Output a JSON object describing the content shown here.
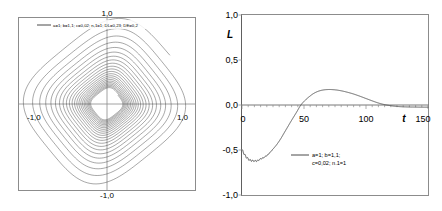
{
  "figure": {
    "background_color": "#ffffff",
    "axis_color": "#8c8c8c",
    "curve_color": "#3c3c3c",
    "panel_count": 2
  },
  "chart_data": [
    {
      "type": "line",
      "name": "phase-portrait",
      "title": "",
      "xlabel": "",
      "ylabel": "",
      "xlim": [
        -1.4,
        1.4
      ],
      "ylim": [
        -1.4,
        1.4
      ],
      "xticks": [
        -1.0,
        1.0
      ],
      "xtick_labels": [
        "-1,0",
        "1,0"
      ],
      "yticks": [
        -1.0,
        1.0
      ],
      "ytick_labels": [
        "-1,0",
        "1,0"
      ],
      "grid": false,
      "legend_position": "top",
      "legend": [
        "a=1; b=1,1; c=0,02; n,1=1; DL=0,23; DE=0,2"
      ],
      "description": "Inward spiralling closed-loop phase trajectory, rounded-square loops decaying from radius ~1.0 toward a dense core near the origin",
      "series": [
        {
          "name": "trajectory",
          "parametric": true,
          "turns": 22,
          "r_start": 1.02,
          "r_end": 0.18,
          "squareness": 0.42,
          "tilt_deg": 38
        }
      ]
    },
    {
      "type": "line",
      "name": "time-series",
      "title": "",
      "xlabel": "t",
      "ylabel": "L",
      "xlim": [
        0,
        150
      ],
      "ylim": [
        -1.0,
        1.0
      ],
      "xticks": [
        0,
        50,
        100,
        150
      ],
      "xtick_labels": [
        "0",
        "50",
        "100",
        "150"
      ],
      "yticks": [
        -1.0,
        -0.5,
        0.0,
        0.5,
        1.0
      ],
      "ytick_labels": [
        "-1,0",
        "-0,5",
        "0,0",
        "0,5",
        "1,0"
      ],
      "grid": false,
      "legend_position": "inside-lower-center",
      "legend": [
        "a=1; b=1,1;",
        "c=0,02; n.1=1"
      ],
      "description": "Damped oscillation of L versus t: begins near -0,50, dips to about -0,62 near t=12, rises through zero at t≈47, peaks at about +0,17 near t=72, returns to zero near t=113 and settles slightly below zero",
      "series": [
        {
          "name": "L(t)",
          "x": [
            0,
            3,
            6,
            9,
            12,
            15,
            18,
            21,
            25,
            28,
            31,
            34,
            37,
            40,
            44,
            47,
            50,
            54,
            58,
            62,
            66,
            70,
            74,
            78,
            82,
            86,
            90,
            95,
            100,
            105,
            110,
            115,
            120,
            125,
            130,
            135,
            140,
            145,
            150
          ],
          "y": [
            -0.5,
            -0.57,
            -0.61,
            -0.62,
            -0.62,
            -0.6,
            -0.58,
            -0.55,
            -0.49,
            -0.44,
            -0.38,
            -0.31,
            -0.24,
            -0.17,
            -0.08,
            -0.01,
            0.04,
            0.09,
            0.13,
            0.155,
            0.168,
            0.172,
            0.17,
            0.163,
            0.152,
            0.138,
            0.122,
            0.098,
            0.072,
            0.046,
            0.022,
            0.004,
            -0.008,
            -0.016,
            -0.02,
            -0.022,
            -0.023,
            -0.024,
            -0.024
          ]
        }
      ]
    }
  ],
  "left_panel": {
    "legend_label": "a=1; b=1,1; c=0,02; n,1=1; DL=0,23; DE=0,2",
    "x_left_label": "-1,0",
    "x_right_label": "1,0",
    "y_top_label": "1,0",
    "y_bottom_label": "-1,0"
  },
  "right_panel": {
    "y_axis_name": "L",
    "x_axis_name": "t",
    "y_labels": [
      "1,0",
      "0,5",
      "0,0",
      "-0,5",
      "-1,0"
    ],
    "x_labels": [
      "0",
      "50",
      "100",
      "150"
    ],
    "legend_line_1": "a=1; b=1,1;",
    "legend_line_2": "c=0,02; n.1=1"
  }
}
